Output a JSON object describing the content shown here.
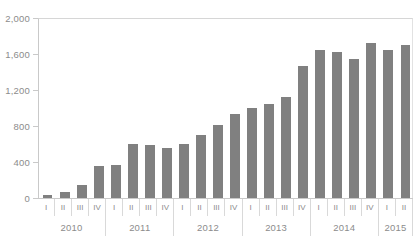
{
  "chart_data": {
    "type": "bar",
    "title": "",
    "subtitle": "",
    "xlabel": "",
    "ylabel": "",
    "ylim": [
      0,
      2000
    ],
    "grid": false,
    "legend": null,
    "bar_color": "#808080",
    "axis_color": "#c9c9c9",
    "label_color": "#8c8c8c",
    "yticks": [
      0,
      400,
      800,
      1200,
      1600,
      2000
    ],
    "ytick_labels": [
      "0",
      "400",
      "800",
      "1,200",
      "1,600",
      "2,000"
    ],
    "categories": [
      "I",
      "II",
      "III",
      "IV",
      "I",
      "II",
      "III",
      "IV",
      "I",
      "II",
      "III",
      "IV",
      "I",
      "II",
      "III",
      "IV",
      "I",
      "II",
      "III",
      "IV",
      "I",
      "II"
    ],
    "values": [
      30,
      70,
      140,
      360,
      370,
      600,
      590,
      560,
      600,
      700,
      810,
      930,
      1000,
      1050,
      1120,
      1470,
      1650,
      1620,
      1540,
      1720,
      1650,
      1700
    ],
    "groups": [
      {
        "label": "2010",
        "count": 4
      },
      {
        "label": "2011",
        "count": 4
      },
      {
        "label": "2012",
        "count": 4
      },
      {
        "label": "2013",
        "count": 4
      },
      {
        "label": "2014",
        "count": 4
      },
      {
        "label": "2015",
        "count": 2
      }
    ]
  }
}
